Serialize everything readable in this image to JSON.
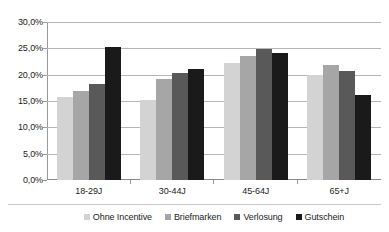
{
  "chart_data": {
    "type": "bar",
    "title": "",
    "subtitle": "",
    "xlabel": "",
    "ylabel": "",
    "categories": [
      "18-29J",
      "30-44J",
      "45-64J",
      "65+J"
    ],
    "series": [
      {
        "name": "Ohne Incentive",
        "color": "#d3d3d3",
        "values": [
          15.7,
          15.1,
          22.2,
          20.0
        ]
      },
      {
        "name": "Briefmarken",
        "color": "#a6a6a6",
        "values": [
          16.9,
          19.1,
          23.5,
          21.9
        ]
      },
      {
        "name": "Verlosung",
        "color": "#595959",
        "values": [
          18.2,
          20.3,
          24.9,
          20.7
        ]
      },
      {
        "name": "Gutschein",
        "color": "#1a1a1a",
        "values": [
          25.3,
          21.0,
          24.2,
          16.1
        ]
      }
    ],
    "ylim": [
      0,
      30
    ],
    "ytick_values": [
      0,
      5,
      10,
      15,
      20,
      25,
      30
    ],
    "ytick_labels": [
      "0,0%",
      "5,0%",
      "10,0%",
      "15,0%",
      "20,0%",
      "25,0%",
      "30,0%"
    ],
    "grid": true,
    "legend_position": "bottom",
    "value_suffix": "%",
    "decimal_separator": ","
  },
  "colors": {
    "background": "#ffffff",
    "gridline": "#b6b6b6",
    "axis": "#9a9a9a",
    "text": "#1c1c1c",
    "legend_separator": "#c9c9c9"
  }
}
